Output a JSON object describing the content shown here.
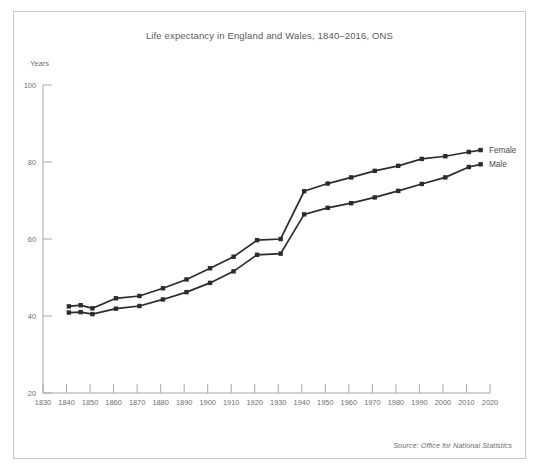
{
  "figure": {
    "title": "Life expectancy in England and Wales, 1840–2016, ONS",
    "source": "Source: Office for National Statistics",
    "frame_color": "#c9c9c9",
    "background": "#ffffff"
  },
  "chart_data": {
    "type": "line",
    "title": "Life expectancy in England and Wales, 1840–2016, ONS",
    "xlabel": "",
    "ylabel": "Years",
    "xlim": [
      1830,
      2020
    ],
    "ylim": [
      20,
      100
    ],
    "xticks": [
      1830,
      1840,
      1850,
      1860,
      1870,
      1880,
      1890,
      1900,
      1910,
      1920,
      1930,
      1940,
      1950,
      1960,
      1970,
      1980,
      1990,
      2000,
      2010,
      2020
    ],
    "yticks": [
      20,
      40,
      60,
      80,
      100
    ],
    "grid": false,
    "legend_position": "right",
    "marker": "square",
    "line_color": "#2b2b2b",
    "series": [
      {
        "name": "Female",
        "x": [
          1841,
          1846,
          1851,
          1861,
          1871,
          1881,
          1891,
          1901,
          1911,
          1921,
          1931,
          1941,
          1951,
          1961,
          1971,
          1981,
          1991,
          2001,
          2011,
          2016
        ],
        "values": [
          42.5,
          42.8,
          42.0,
          44.6,
          45.2,
          47.2,
          49.5,
          52.4,
          55.4,
          59.7,
          60.0,
          72.4,
          74.4,
          76.0,
          77.7,
          79.0,
          80.8,
          81.5,
          82.6,
          83.1
        ]
      },
      {
        "name": "Male",
        "x": [
          1841,
          1846,
          1851,
          1861,
          1871,
          1881,
          1891,
          1901,
          1911,
          1921,
          1931,
          1941,
          1951,
          1961,
          1971,
          1981,
          1991,
          2001,
          2011,
          2016
        ],
        "values": [
          40.9,
          41.0,
          40.5,
          41.9,
          42.6,
          44.3,
          46.2,
          48.6,
          51.6,
          55.9,
          56.2,
          66.4,
          68.1,
          69.3,
          70.8,
          72.5,
          74.3,
          76.0,
          78.7,
          79.4
        ]
      }
    ]
  },
  "legend": {
    "items": [
      {
        "label": "Female"
      },
      {
        "label": "Male"
      }
    ]
  }
}
